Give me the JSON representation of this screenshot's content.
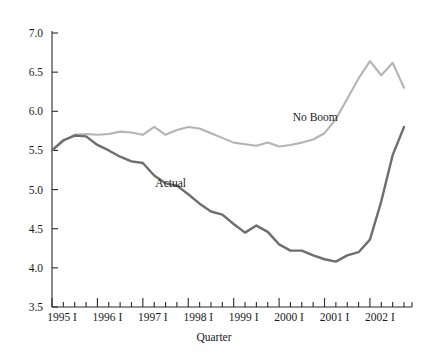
{
  "chart_data": {
    "type": "line",
    "title": "",
    "xlabel": "Quarter",
    "ylabel": "",
    "ylim": [
      3.5,
      7.0
    ],
    "ytick_values": [
      3.5,
      4.0,
      4.5,
      5.0,
      5.5,
      6.0,
      6.5,
      7.0
    ],
    "ytick_labels": [
      "3.5",
      "4.0",
      "4.5",
      "5.0",
      "5.5",
      "6.0",
      "6.5",
      "7.0"
    ],
    "grid": false,
    "legend_position": "inline-annotations",
    "x_quarter_count": 32,
    "x": [
      "1995 I",
      "1995 II",
      "1995 III",
      "1995 IV",
      "1996 I",
      "1996 II",
      "1996 III",
      "1996 IV",
      "1997 I",
      "1997 II",
      "1997 III",
      "1997 IV",
      "1998 I",
      "1998 II",
      "1998 III",
      "1998 IV",
      "1999 I",
      "1999 II",
      "1999 III",
      "1999 IV",
      "2000 I",
      "2000 II",
      "2000 III",
      "2000 IV",
      "2001 I",
      "2001 II",
      "2001 III",
      "2001 IV",
      "2002 I",
      "2002 II",
      "2002 III",
      "2002 IV"
    ],
    "xtick_labels": [
      "1995 I",
      "1996 I",
      "1997 I",
      "1998 I",
      "1999 I",
      "2000 I",
      "2001 I",
      "2002 I"
    ],
    "xtick_indices": [
      0,
      4,
      8,
      12,
      16,
      20,
      24,
      28
    ],
    "series": [
      {
        "name": "No Boom",
        "color": "#b4b4b4",
        "label_x_index": 21.2,
        "label_y_value": 5.88,
        "values": [
          5.5,
          5.62,
          5.7,
          5.71,
          5.7,
          5.71,
          5.74,
          5.73,
          5.7,
          5.8,
          5.7,
          5.76,
          5.8,
          5.78,
          5.72,
          5.66,
          5.6,
          5.58,
          5.56,
          5.6,
          5.55,
          5.57,
          5.6,
          5.64,
          5.72,
          5.9,
          6.16,
          6.42,
          6.64,
          6.46,
          6.62,
          6.3
        ]
      },
      {
        "name": "Actual",
        "color": "#6e6e6e",
        "label_x_index": 9.1,
        "label_y_value": 5.03,
        "values": [
          5.5,
          5.63,
          5.69,
          5.68,
          5.57,
          5.5,
          5.42,
          5.36,
          5.34,
          5.18,
          5.08,
          5.05,
          4.94,
          4.82,
          4.72,
          4.68,
          4.56,
          4.45,
          4.54,
          4.46,
          4.3,
          4.22,
          4.22,
          4.16,
          4.11,
          4.08,
          4.16,
          4.2,
          4.36,
          4.85,
          5.44,
          5.8
        ]
      }
    ],
    "series_extra_points": {
      "Actual_tail": [
        5.8,
        5.95,
        5.82
      ]
    }
  }
}
